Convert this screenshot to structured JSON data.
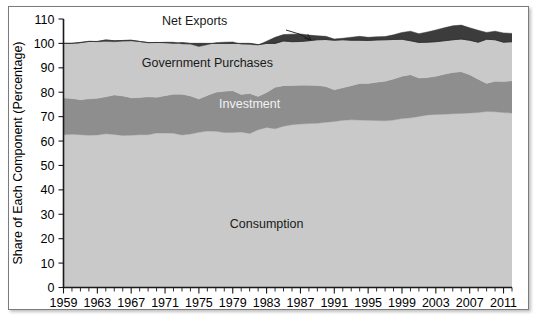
{
  "chart_data": {
    "type": "area",
    "title": "",
    "xlabel": "",
    "ylabel": "Share of Each Component (Percentage)",
    "xlim": [
      1959,
      2012
    ],
    "ylim": [
      0,
      110
    ],
    "ytick_labels": [
      "0",
      "10",
      "20",
      "30",
      "40",
      "50",
      "60",
      "70",
      "80",
      "90",
      "100",
      "110"
    ],
    "ytick_values": [
      0,
      10,
      20,
      30,
      40,
      50,
      60,
      70,
      80,
      90,
      100,
      110
    ],
    "xtick_labels": [
      "1959",
      "1963",
      "1967",
      "1971",
      "1975",
      "1979",
      "1983",
      "1987",
      "1991",
      "1995",
      "1999",
      "2003",
      "2007",
      "2011"
    ],
    "xtick_values": [
      1959,
      1963,
      1967,
      1971,
      1975,
      1979,
      1983,
      1987,
      1991,
      1995,
      1999,
      2003,
      2007,
      2011
    ],
    "grid": false,
    "legend": "inline-annotations",
    "stacked": true,
    "annotations": [
      {
        "name": "net-exports-label",
        "text": "Net Exports",
        "x": 1974.5,
        "y": 107.5
      },
      {
        "name": "government-purchases-label",
        "text": "Government Purchases",
        "x": 1976.0,
        "y": 90.5
      },
      {
        "name": "investment-label",
        "text": "Investment",
        "x": 1981.0,
        "y": 73.5
      },
      {
        "name": "consumption-label",
        "text": "Consumption",
        "x": 1983.0,
        "y": 24.5
      }
    ],
    "x": [
      1959,
      1960,
      1961,
      1962,
      1963,
      1964,
      1965,
      1966,
      1967,
      1968,
      1969,
      1970,
      1971,
      1972,
      1973,
      1974,
      1975,
      1976,
      1977,
      1978,
      1979,
      1980,
      1981,
      1982,
      1983,
      1984,
      1985,
      1986,
      1987,
      1988,
      1989,
      1990,
      1991,
      1992,
      1993,
      1994,
      1995,
      1996,
      1997,
      1998,
      1999,
      2000,
      2001,
      2002,
      2003,
      2004,
      2005,
      2006,
      2007,
      2008,
      2009,
      2010,
      2011,
      2012
    ],
    "series": [
      {
        "name": "Consumption",
        "color": "#c9c9c9",
        "values": [
          62.6,
          62.8,
          62.6,
          62.4,
          62.5,
          63.0,
          62.7,
          62.3,
          62.4,
          62.6,
          62.6,
          63.3,
          63.3,
          63.2,
          62.5,
          62.9,
          63.6,
          64.1,
          64.0,
          63.5,
          63.5,
          63.7,
          63.1,
          64.6,
          65.6,
          65.0,
          66.1,
          66.7,
          67.0,
          67.2,
          67.3,
          67.7,
          68.0,
          68.5,
          68.7,
          68.6,
          68.5,
          68.4,
          68.3,
          68.6,
          69.2,
          69.5,
          70.1,
          70.7,
          70.9,
          71.0,
          71.2,
          71.3,
          71.5,
          71.7,
          72.1,
          72.0,
          71.7,
          71.5
        ]
      },
      {
        "name": "Investment",
        "color": "#8e8e8e",
        "values": [
          15.0,
          14.6,
          14.3,
          14.9,
          15.0,
          15.1,
          16.2,
          16.2,
          15.3,
          15.2,
          15.5,
          14.6,
          15.3,
          16.0,
          16.7,
          15.6,
          13.6,
          14.6,
          16.0,
          16.9,
          17.1,
          15.4,
          16.4,
          13.7,
          14.3,
          17.0,
          16.6,
          16.1,
          15.9,
          15.7,
          15.5,
          14.6,
          13.0,
          13.3,
          14.0,
          15.0,
          15.1,
          15.7,
          16.2,
          16.8,
          17.3,
          17.7,
          15.7,
          15.3,
          15.6,
          16.4,
          16.9,
          17.1,
          15.7,
          13.6,
          11.5,
          12.5,
          12.7,
          13.2
        ]
      },
      {
        "name": "Government Purchases",
        "color": "#c9c9c9",
        "values": [
          22.5,
          22.7,
          23.3,
          23.6,
          23.2,
          22.7,
          21.8,
          22.4,
          23.3,
          23.0,
          22.3,
          22.4,
          21.9,
          21.3,
          20.6,
          21.2,
          21.5,
          20.8,
          20.3,
          20.1,
          20.0,
          20.6,
          20.1,
          21.0,
          21.0,
          20.5,
          20.9,
          21.0,
          21.0,
          20.5,
          20.3,
          20.6,
          20.8,
          20.3,
          19.8,
          19.3,
          18.9,
          18.6,
          18.3,
          18.1,
          18.0,
          17.8,
          18.2,
          18.7,
          19.0,
          19.0,
          19.1,
          19.1,
          19.2,
          20.1,
          20.9,
          20.5,
          19.9,
          19.4
        ]
      },
      {
        "name": "Net Exports",
        "color": "#3c3c3c",
        "values": [
          -0.1,
          -0.1,
          0.2,
          -0.1,
          0.1,
          0.6,
          0.4,
          0.3,
          0.3,
          0.0,
          -0.1,
          0.1,
          -0.2,
          -0.4,
          0.5,
          0.3,
          1.3,
          0.5,
          -0.3,
          -0.5,
          -0.6,
          0.3,
          0.4,
          0.2,
          -0.9,
          -2.5,
          -2.6,
          -3.1,
          -3.1,
          -2.3,
          -1.6,
          -1.3,
          -0.5,
          -0.6,
          -1.2,
          -1.6,
          -1.3,
          -1.3,
          -1.3,
          -1.9,
          -2.8,
          -3.9,
          -3.6,
          -4.2,
          -4.8,
          -5.3,
          -5.7,
          -5.7,
          -5.1,
          -4.9,
          -2.8,
          -3.5,
          -3.8,
          -3.4
        ]
      }
    ]
  },
  "colors": {
    "consumption": "#c9c9c9",
    "investment": "#8e8e8e",
    "government": "#c9c9c9",
    "net_exports": "#3c3c3c",
    "axis": "#1a1a1a",
    "frame": "#7b7b7b",
    "page_background": "#ffffff"
  }
}
